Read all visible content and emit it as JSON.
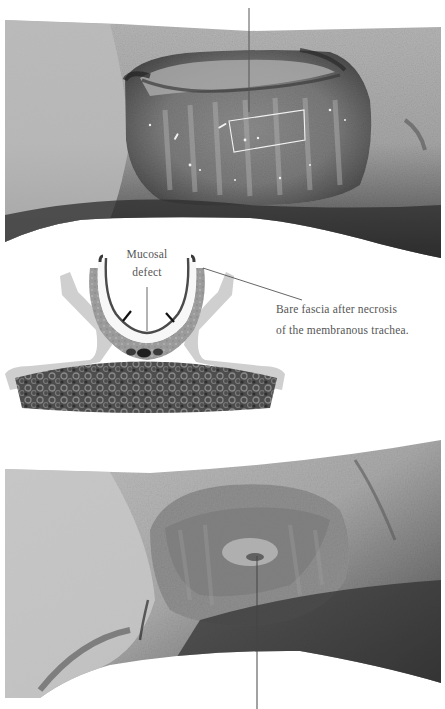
{
  "figure": {
    "panels": [
      {
        "id": "top-photo",
        "description": "Intraoperative photograph, tracheal wound before treatment (grayscale)",
        "highlight_box": true
      },
      {
        "id": "schematic",
        "description": "Cross-section schematic of trachea over esophagus"
      },
      {
        "id": "bottom-photo",
        "description": "Intraoperative photograph, tracheal wound after healing (grayscale)"
      }
    ],
    "labels": {
      "mucosal_defect_line1": "Mucosal",
      "mucosal_defect_line2": "defect",
      "bare_fascia_line1": "Bare fascia after necrosis",
      "bare_fascia_line2": "of the membranous trachea."
    },
    "colors": {
      "background": "#ffffff",
      "text": "#555555",
      "leader_line": "#555555",
      "box_outline": "#f2f2f2",
      "skin_light": "#c9c9c9",
      "skin_mid": "#9a9a9a",
      "tissue_dark": "#3a3a3a",
      "schematic_outer": "#cfcfcf",
      "schematic_mid": "#9b9b9b",
      "schematic_cartilage": "#f7f7f7",
      "schematic_mucosa": "#4a4a4a",
      "esophagus": "#5a5a5a"
    }
  }
}
